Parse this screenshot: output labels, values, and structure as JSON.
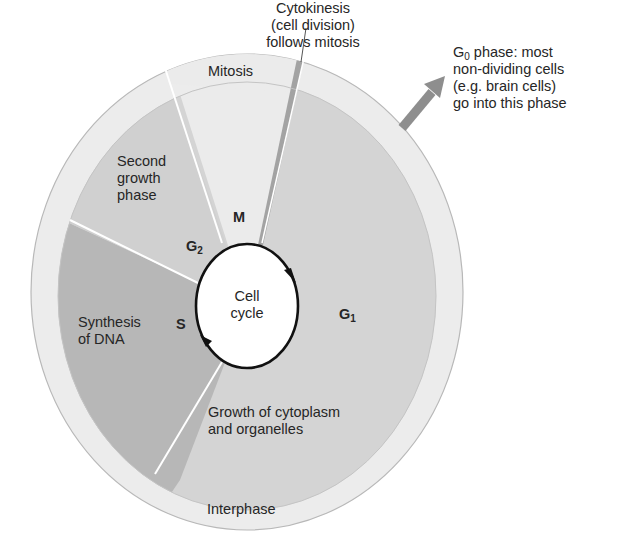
{
  "diagram": {
    "title": "Cell cycle",
    "center_label": [
      "Cell",
      "cycle"
    ],
    "ring_label": "Interphase",
    "phases": [
      {
        "id": "M",
        "code": "M",
        "description": [
          "Mitosis"
        ],
        "color": "#eaeaea"
      },
      {
        "id": "G1",
        "code": "G",
        "subscript": "1",
        "description": [
          "Growth of cytoplasm",
          "and organelles"
        ],
        "color": "#d4d4d4"
      },
      {
        "id": "S",
        "code": "S",
        "description": [
          "Synthesis",
          "of DNA"
        ],
        "color": "#b7b7b7"
      },
      {
        "id": "G2",
        "code": "G",
        "subscript": "2",
        "description": [
          "Second",
          "growth",
          "phase"
        ],
        "color": "#d0d0d0"
      }
    ],
    "cytokinesis": {
      "text": [
        "Cytokinesis",
        "(cell division)",
        "follows mitosis"
      ],
      "color": "#a3a3a3"
    },
    "g0": {
      "code": "G",
      "subscript": "0",
      "text_line1_rest": " phase: most",
      "text": [
        "non-dividing cells",
        "(e.g. brain cells)",
        "go into this phase"
      ],
      "arrow_color": "#8e8e8e"
    },
    "colors": {
      "outer_ring": "#ececec",
      "ring_stroke": "#b8b8b8",
      "divider": "#ffffff",
      "cycle_circle_stroke": "#111111",
      "cycle_circle_fill": "#ffffff"
    }
  }
}
